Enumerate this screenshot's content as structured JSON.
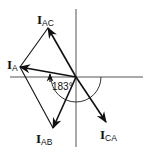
{
  "diagram": {
    "type": "phasor-diagram",
    "origin": [
      76,
      77
    ],
    "axes": {
      "horizontal": {
        "x1": 10,
        "x2": 143,
        "y": 77
      },
      "vertical": {
        "x": 76,
        "y1": 9,
        "y2": 147
      }
    },
    "vectors": [
      {
        "id": "I_AC",
        "main": "I",
        "sub": "AC",
        "tip": [
          48,
          28
        ],
        "label_pos": [
          37,
          24
        ]
      },
      {
        "id": "I_A",
        "main": "I",
        "sub": "A",
        "tip": [
          20,
          67
        ],
        "label_pos": [
          7,
          68
        ]
      },
      {
        "id": "I_AB",
        "main": "I",
        "sub": "AB",
        "tip": [
          53,
          128
        ],
        "label_pos": [
          36,
          144
        ]
      },
      {
        "id": "I_CA",
        "main": "I",
        "sub": "CA",
        "tip": [
          106,
          122
        ],
        "label_pos": [
          99,
          140
        ]
      }
    ],
    "angle": {
      "label": "183°",
      "label_pos": [
        51,
        89
      ]
    },
    "colors": {
      "stroke": "#111111",
      "axis": "#555555",
      "background": "#ffffff"
    }
  }
}
